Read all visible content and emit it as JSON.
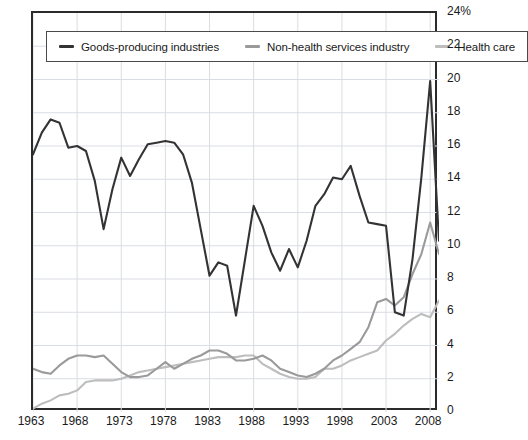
{
  "chart_data": {
    "type": "line",
    "title": "",
    "xlabel": "",
    "ylabel": "",
    "xlim": [
      1963,
      2009
    ],
    "ylim": [
      0,
      24
    ],
    "ytick_labels": [
      "24%",
      "22",
      "20",
      "18",
      "16",
      "14",
      "12",
      "10",
      "8",
      "6",
      "4",
      "2",
      "0"
    ],
    "ytick_values": [
      24,
      22,
      20,
      18,
      16,
      14,
      12,
      10,
      8,
      6,
      4,
      2,
      0
    ],
    "xtick_labels": [
      "1963",
      "1968",
      "1973",
      "1978",
      "1983",
      "1988",
      "1993",
      "1998",
      "2003",
      "2008"
    ],
    "xtick_values": [
      1963,
      1968,
      1973,
      1978,
      1983,
      1988,
      1993,
      1998,
      2003,
      2008
    ],
    "grid": true,
    "grid_color": "#d9dde4",
    "legend_position": "top-inside",
    "x": [
      1963,
      1964,
      1965,
      1966,
      1967,
      1968,
      1969,
      1970,
      1971,
      1972,
      1973,
      1974,
      1975,
      1976,
      1977,
      1978,
      1979,
      1980,
      1981,
      1982,
      1983,
      1984,
      1985,
      1986,
      1987,
      1988,
      1989,
      1990,
      1991,
      1992,
      1993,
      1994,
      1995,
      1996,
      1997,
      1998,
      1999,
      2000,
      2001,
      2002,
      2003,
      2004,
      2005,
      2006,
      2007,
      2008,
      2009
    ],
    "series": [
      {
        "name": "Goods-producing industries",
        "color": "#333333",
        "width": 2.1,
        "values": [
          15.5,
          16.8,
          17.6,
          17.4,
          15.9,
          16.0,
          15.7,
          13.9,
          11.0,
          13.4,
          15.3,
          14.2,
          15.2,
          16.1,
          16.2,
          16.3,
          16.2,
          15.5,
          13.8,
          11.0,
          8.2,
          9.0,
          8.8,
          5.8,
          9.1,
          12.4,
          11.2,
          9.6,
          8.5,
          9.8,
          8.7,
          10.3,
          12.4,
          13.1,
          14.1,
          14.0,
          14.8,
          13.0,
          11.4,
          11.3,
          11.2,
          6.0,
          5.8,
          9.2,
          14.1,
          19.9,
          10.3
        ]
      },
      {
        "name": "Non-health services industry",
        "color": "#9a9a9a",
        "width": 2.1,
        "values": [
          2.6,
          2.4,
          2.3,
          2.8,
          3.2,
          3.4,
          3.4,
          3.3,
          3.4,
          2.9,
          2.4,
          2.1,
          2.1,
          2.2,
          2.6,
          3.0,
          2.6,
          2.9,
          3.2,
          3.4,
          3.7,
          3.7,
          3.5,
          3.1,
          3.1,
          3.2,
          3.4,
          3.1,
          2.6,
          2.4,
          2.2,
          2.1,
          2.3,
          2.6,
          3.1,
          3.4,
          3.8,
          4.2,
          5.1,
          6.6,
          6.8,
          6.4,
          6.9,
          8.3,
          9.5,
          11.4,
          9.5
        ]
      },
      {
        "name": "Health care",
        "color": "#bdbdbd",
        "width": 2.1,
        "values": [
          0.2,
          0.5,
          0.7,
          1.0,
          1.1,
          1.3,
          1.8,
          1.9,
          1.9,
          1.9,
          2.0,
          2.2,
          2.4,
          2.5,
          2.6,
          2.7,
          2.8,
          2.9,
          3.0,
          3.1,
          3.2,
          3.3,
          3.3,
          3.3,
          3.4,
          3.4,
          2.9,
          2.6,
          2.3,
          2.1,
          2.0,
          2.0,
          2.1,
          2.6,
          2.6,
          2.8,
          3.1,
          3.3,
          3.5,
          3.7,
          4.3,
          4.7,
          5.2,
          5.6,
          5.9,
          5.7,
          6.7
        ]
      }
    ]
  },
  "legend": {
    "items": [
      {
        "label": "Goods-producing industries",
        "color": "#333333"
      },
      {
        "label": "Non-health services industry",
        "color": "#9a9a9a"
      },
      {
        "label": "Health care",
        "color": "#bdbdbd"
      }
    ]
  }
}
